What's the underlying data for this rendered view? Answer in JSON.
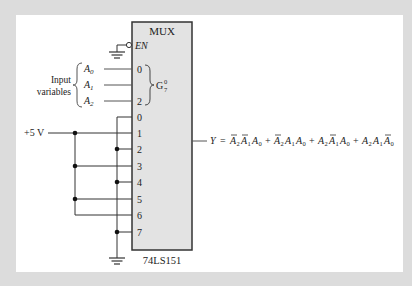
{
  "diagram": {
    "chip": {
      "title": "MUX",
      "part_number": "74LS151",
      "enable_label": "EN",
      "select_group_label": "G",
      "select_group_sup": "0",
      "select_group_sub": "7",
      "select_pins": [
        "0",
        "",
        "2"
      ],
      "data_pins": [
        "0",
        "1",
        "2",
        "3",
        "4",
        "5",
        "6",
        "7"
      ],
      "fill_color": "#e3e3e3",
      "border_color": "#333333"
    },
    "inputs": {
      "group_label_line1": "Input",
      "group_label_line2": "variables",
      "variables": [
        {
          "name": "A",
          "sub": "0"
        },
        {
          "name": "A",
          "sub": "1"
        },
        {
          "name": "A",
          "sub": "2"
        }
      ]
    },
    "supply": {
      "label": "+5 V",
      "connected_pins": [
        "1",
        "3",
        "5",
        "6"
      ]
    },
    "ground": {
      "connected_pins": [
        "0",
        "2",
        "4",
        "7"
      ]
    },
    "output": {
      "lhs": "Y",
      "eq": "=",
      "terms": [
        [
          {
            "v": "A",
            "s": "2",
            "bar": true
          },
          {
            "v": "A",
            "s": "1",
            "bar": true
          },
          {
            "v": "A",
            "s": "0",
            "bar": false
          }
        ],
        [
          {
            "v": "A",
            "s": "2",
            "bar": true
          },
          {
            "v": "A",
            "s": "1",
            "bar": false
          },
          {
            "v": "A",
            "s": "0",
            "bar": false
          }
        ],
        [
          {
            "v": "A",
            "s": "2",
            "bar": false
          },
          {
            "v": "A",
            "s": "1",
            "bar": true
          },
          {
            "v": "A",
            "s": "0",
            "bar": false
          }
        ],
        [
          {
            "v": "A",
            "s": "2",
            "bar": false
          },
          {
            "v": "A",
            "s": "1",
            "bar": false
          },
          {
            "v": "A",
            "s": "0",
            "bar": true
          }
        ]
      ],
      "plus": "+"
    }
  }
}
